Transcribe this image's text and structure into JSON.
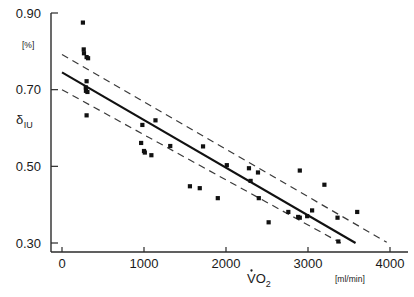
{
  "chart_data": {
    "type": "scatter",
    "title": "",
    "xlabel": "VO2",
    "xlabel_unit": "[ml/min]",
    "ylabel": "δ",
    "ylabel_sub": "IU",
    "ylabel_unit": "[%]",
    "xlim": [
      0,
      4000
    ],
    "ylim": [
      0.3,
      0.9
    ],
    "xticks": [
      0,
      1000,
      2000,
      3000,
      4000
    ],
    "xtick_labels": [
      "0",
      "1000",
      "2000",
      "3000",
      "4000"
    ],
    "yticks": [
      0.3,
      0.5,
      0.7,
      0.9
    ],
    "ytick_labels": [
      "0.30",
      "0.50",
      "0.70",
      "0.90"
    ],
    "grid": false,
    "legend": "none",
    "marker": "square",
    "marker_color": "#111111",
    "points": [
      {
        "x": 255,
        "y": 0.875
      },
      {
        "x": 265,
        "y": 0.805
      },
      {
        "x": 268,
        "y": 0.795
      },
      {
        "x": 300,
        "y": 0.785
      },
      {
        "x": 318,
        "y": 0.782
      },
      {
        "x": 300,
        "y": 0.722
      },
      {
        "x": 290,
        "y": 0.706
      },
      {
        "x": 292,
        "y": 0.697
      },
      {
        "x": 310,
        "y": 0.694
      },
      {
        "x": 300,
        "y": 0.633
      },
      {
        "x": 980,
        "y": 0.608
      },
      {
        "x": 1140,
        "y": 0.62
      },
      {
        "x": 965,
        "y": 0.561
      },
      {
        "x": 1000,
        "y": 0.54
      },
      {
        "x": 1010,
        "y": 0.536
      },
      {
        "x": 1090,
        "y": 0.529
      },
      {
        "x": 1320,
        "y": 0.553
      },
      {
        "x": 1560,
        "y": 0.448
      },
      {
        "x": 1680,
        "y": 0.443
      },
      {
        "x": 1720,
        "y": 0.552
      },
      {
        "x": 1900,
        "y": 0.417
      },
      {
        "x": 2010,
        "y": 0.503
      },
      {
        "x": 2280,
        "y": 0.495
      },
      {
        "x": 2300,
        "y": 0.462
      },
      {
        "x": 2390,
        "y": 0.484
      },
      {
        "x": 2400,
        "y": 0.417
      },
      {
        "x": 2520,
        "y": 0.354
      },
      {
        "x": 2760,
        "y": 0.381
      },
      {
        "x": 2880,
        "y": 0.368
      },
      {
        "x": 2900,
        "y": 0.366
      },
      {
        "x": 2900,
        "y": 0.489
      },
      {
        "x": 2990,
        "y": 0.37
      },
      {
        "x": 3050,
        "y": 0.385
      },
      {
        "x": 3200,
        "y": 0.452
      },
      {
        "x": 3360,
        "y": 0.366
      },
      {
        "x": 3370,
        "y": 0.304
      },
      {
        "x": 3600,
        "y": 0.381
      }
    ],
    "fit_line": {
      "name": "regression-line",
      "style": "solid",
      "x_start": 0,
      "y_start": 0.745,
      "x_end": 3580,
      "y_end": 0.3
    },
    "confidence_bands": [
      {
        "name": "upper-confidence-band",
        "style": "dashed",
        "x_start": 0,
        "y_start": 0.792,
        "x_end": 3960,
        "y_end": 0.302
      },
      {
        "name": "lower-confidence-band",
        "style": "dashed",
        "x_start": 0,
        "y_start": 0.7,
        "x_end": 3400,
        "y_end": 0.3
      }
    ]
  }
}
